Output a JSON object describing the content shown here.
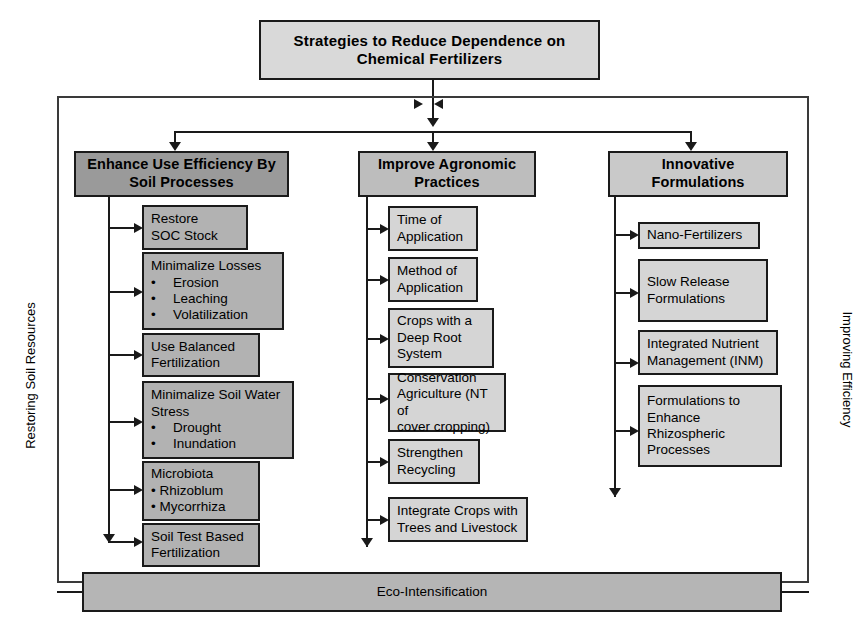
{
  "title": {
    "text": "Strategies to Reduce Dependence on\nChemical Fertilizers"
  },
  "side_labels": {
    "left": "Restoring Soil Resources",
    "right": "Improving Efficiency"
  },
  "footer": {
    "text": "Eco-Intensification"
  },
  "columns": [
    {
      "header": "Enhance Use Efficiency By\nSoil Processes",
      "items": [
        {
          "text": "Restore\nSOC Stock"
        },
        {
          "text": "Minimalize Losses\n•  Erosion\n•  Leaching\n•  Volatilization"
        },
        {
          "text": "Use Balanced\nFertilization"
        },
        {
          "text": "Minimalize Soil Water\nStress\n•  Drought\n•  Inundation"
        },
        {
          "text": "Microbiota\n• Rhizoblum\n• Mycorrhiza"
        },
        {
          "text": "Soil Test Based\nFertilization"
        }
      ]
    },
    {
      "header": "Improve Agronomic\nPractices",
      "items": [
        {
          "text": "Time of\nApplication"
        },
        {
          "text": "Method of\nApplication"
        },
        {
          "text": "Crops with a\nDeep Root\nSystem"
        },
        {
          "text": "Conservation\nAgriculture (NT of\ncover cropping)"
        },
        {
          "text": "Strengthen\nRecycling"
        },
        {
          "text": "Integrate Crops with\nTrees and Livestock"
        }
      ]
    },
    {
      "header": "Innovative Formulations",
      "items": [
        {
          "text": "Nano-Fertilizers"
        },
        {
          "text": "Slow Release\nFormulations"
        },
        {
          "text": "Integrated Nutrient\nManagement (INM)"
        },
        {
          "text": "Formulations to\nEnhance\nRhizospheric\nProcesses"
        }
      ]
    }
  ],
  "colors": {
    "title_fill": "#d9d9d9",
    "header_dark": "#9a9a9a",
    "header_mid": "#bdbdbd",
    "item_dark": "#b2b2b2",
    "item_light": "#d5d5d5",
    "footer_fill": "#b5b5b5",
    "stroke": "#1a1a1a"
  }
}
